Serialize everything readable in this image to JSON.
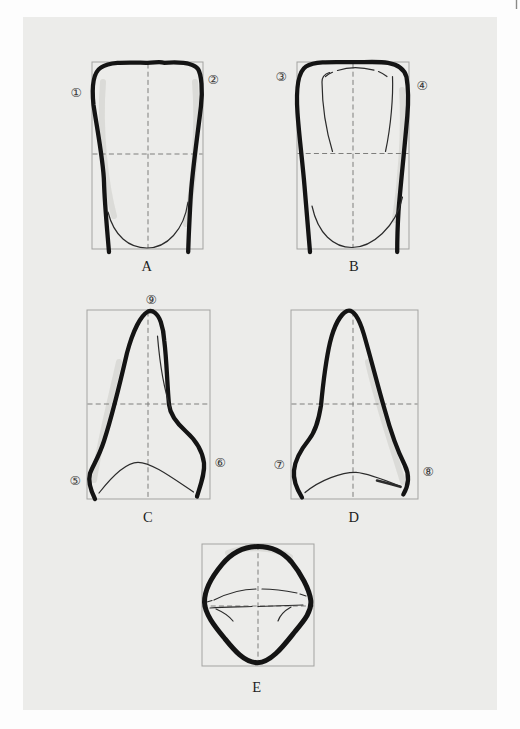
{
  "figure": {
    "panels": {
      "A": {
        "label": "A"
      },
      "B": {
        "label": "B"
      },
      "C": {
        "label": "C"
      },
      "D": {
        "label": "D"
      },
      "E": {
        "label": "E"
      }
    },
    "markers": {
      "m1": "①",
      "m2": "②",
      "m3": "③",
      "m4": "④",
      "m5": "⑤",
      "m6": "⑥",
      "m7": "⑦",
      "m8": "⑧",
      "m9": "⑨"
    },
    "colors": {
      "paper": "#ececea",
      "page": "#fdfdfd",
      "frame": "#a3a3a1",
      "guide": "#7e7e7c",
      "ink": "#141414",
      "thin_ink": "#2b2b2b"
    }
  }
}
